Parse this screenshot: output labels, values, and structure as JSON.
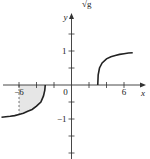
{
  "header": {
    "clipped_label": "√g"
  },
  "chart_data": {
    "type": "line",
    "title": "",
    "xlabel": "x",
    "ylabel": "y",
    "xlim": [
      -8,
      7.5
    ],
    "ylim": [
      -2,
      3.5
    ],
    "x_ticks": [
      -6,
      -4,
      -2,
      0,
      2,
      4,
      6
    ],
    "x_tick_labels": [
      {
        "value": -6,
        "label": "−6"
      },
      {
        "value": 0,
        "label": "0"
      },
      {
        "value": 6,
        "label": "6"
      }
    ],
    "y_ticks": [
      -2,
      -1.5,
      -1,
      -0.5,
      0.5,
      1,
      1.5,
      2,
      2.5,
      3
    ],
    "y_tick_labels": [
      {
        "value": 1,
        "label": "1"
      },
      {
        "value": -1,
        "label": "−1"
      }
    ],
    "series": [
      {
        "name": "right-branch",
        "description": "curve starting at x=3, rising toward ~1",
        "x": [
          3,
          3.05,
          3.2,
          3.5,
          4,
          4.5,
          5,
          5.5,
          6,
          6.5,
          7
        ],
        "y": [
          0,
          0.3,
          0.5,
          0.65,
          0.77,
          0.83,
          0.87,
          0.9,
          0.92,
          0.94,
          0.95
        ]
      },
      {
        "name": "left-branch",
        "description": "curve ending at x=-3, decreasing from ~-0.95",
        "x": [
          -8,
          -7,
          -6.5,
          -6,
          -5.5,
          -5,
          -4.5,
          -4,
          -3.5,
          -3.2,
          -3.05,
          -3
        ],
        "y": [
          -0.95,
          -0.92,
          -0.9,
          -0.87,
          -0.83,
          -0.77,
          -0.72,
          -0.62,
          -0.5,
          -0.32,
          -0.15,
          0
        ]
      }
    ],
    "shaded_region": {
      "description": "area between left branch and x-axis from x=-6 to x=-3",
      "x_from": -6,
      "x_to": -3,
      "color": "#e8e8e8"
    },
    "dashed_guide": {
      "x": -6,
      "from_y": 0,
      "to_y": -0.87
    },
    "grid": false,
    "legend": "none",
    "colors": {
      "curve": "#222222",
      "axis": "#333333",
      "shade": "#e6e6e6"
    }
  }
}
